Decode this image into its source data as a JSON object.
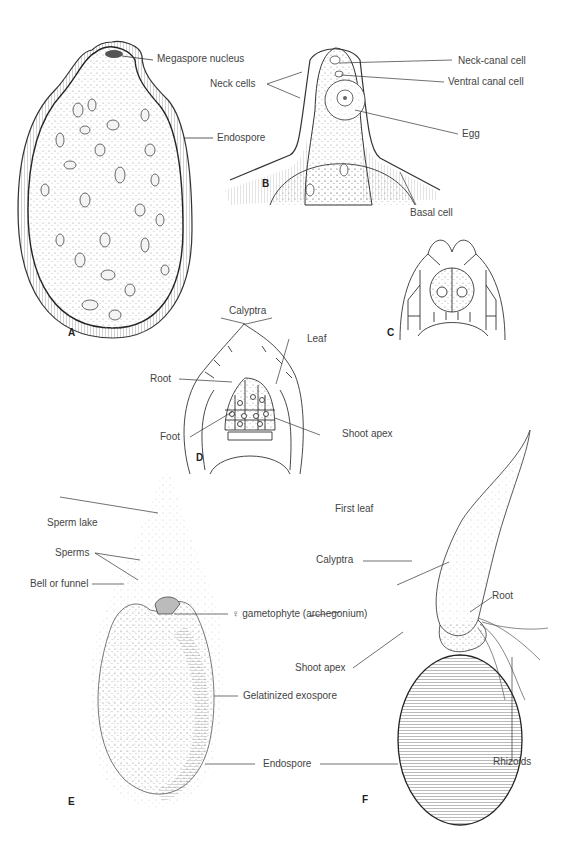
{
  "figure": {
    "panels": [
      {
        "id": "A",
        "labels": [
          "Megaspore nucleus",
          "Endospore"
        ]
      },
      {
        "id": "B",
        "labels": [
          "Neck-canal cell",
          "Ventral canal cell",
          "Neck cells",
          "Egg",
          "Basal cell"
        ]
      },
      {
        "id": "C",
        "labels": []
      },
      {
        "id": "D",
        "labels": [
          "Calyptra",
          "Leaf",
          "Root",
          "Foot",
          "Shoot apex"
        ]
      },
      {
        "id": "E",
        "labels": [
          "Sperm lake",
          "Sperms",
          "Bell or funnel",
          "♀ gametophyte (archegonium)",
          "Gelatinized exospore",
          "Endospore"
        ]
      },
      {
        "id": "F",
        "labels": [
          "First leaf",
          "Calyptra",
          "Root",
          "Shoot apex",
          "Rhizoids"
        ]
      }
    ]
  },
  "labels": {
    "a_megaspore_nucleus": "Megaspore nucleus",
    "a_endospore": "Endospore",
    "b_neck_canal_cell": "Neck-canal cell",
    "b_ventral_canal_cell": "Ventral canal cell",
    "b_neck_cells": "Neck cells",
    "b_egg": "Egg",
    "b_basal_cell": "Basal cell",
    "d_calyptra": "Calyptra",
    "d_leaf": "Leaf",
    "d_root": "Root",
    "d_foot": "Foot",
    "d_shoot_apex": "Shoot apex",
    "e_sperm_lake": "Sperm lake",
    "e_sperms": "Sperms",
    "e_bell_or_funnel": "Bell or funnel",
    "e_gametophyte": "♀ gametophyte (archegonium)",
    "e_gelatinized_exospore": "Gelatinized exospore",
    "e_endospore": "Endospore",
    "f_first_leaf": "First leaf",
    "f_calyptra": "Calyptra",
    "f_root": "Root",
    "f_shoot_apex": "Shoot apex",
    "f_rhizoids": "Rhizoids"
  },
  "panel_letters": {
    "a": "A",
    "b": "B",
    "c": "C",
    "d": "D",
    "e": "E",
    "f": "F"
  },
  "colors": {
    "ink": "#333333",
    "stipple": "#9a9a9a",
    "background": "#ffffff"
  }
}
